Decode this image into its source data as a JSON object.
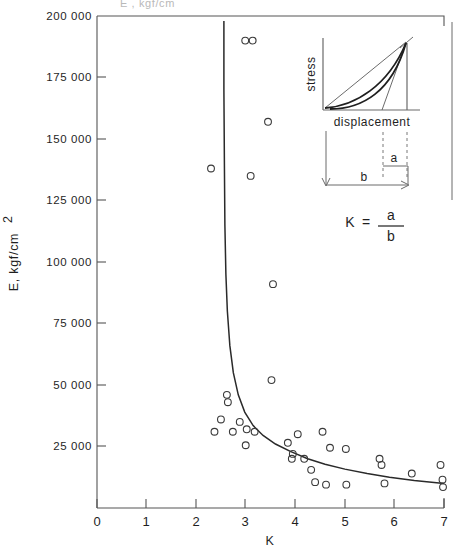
{
  "figure": {
    "top_cropped_text": "E , kgf/cm",
    "background_color": "#ffffff",
    "line_color": "#2a2a2a",
    "marker_color": "#3a3a3a"
  },
  "inset": {
    "y_label": "stress",
    "x_label": "displacement",
    "segment_a_label": "a",
    "segment_b_label": "b",
    "formula_lhs": "K",
    "formula_equals": "=",
    "formula_numerator": "a",
    "formula_denominator": "b"
  },
  "chart_data": {
    "type": "scatter",
    "title": "",
    "xlabel": "K",
    "ylabel": "E, kgf/cm2",
    "ylabel_display": "E, kgf/cm",
    "ylabel_exponent": "2",
    "xlim": [
      0,
      7
    ],
    "ylim": [
      0,
      200000
    ],
    "grid": false,
    "legend": "none",
    "xticks": [
      0,
      1,
      2,
      3,
      4,
      5,
      6,
      7
    ],
    "xtick_labels": [
      "0",
      "1",
      "2",
      "3",
      "4",
      "5",
      "6",
      "7"
    ],
    "yticks": [
      25000,
      50000,
      75000,
      100000,
      125000,
      150000,
      175000,
      200000
    ],
    "ytick_labels": [
      "25 000",
      "50 000",
      "75 000",
      "100 000",
      "125 000",
      "150 000",
      "175 000",
      "200 000"
    ],
    "series": [
      {
        "name": "measurements",
        "marker": "open-circle",
        "points": [
          [
            2.3,
            138000
          ],
          [
            2.99,
            190000
          ],
          [
            3.14,
            190000
          ],
          [
            3.1,
            135000
          ],
          [
            3.45,
            157000
          ],
          [
            3.55,
            91000
          ],
          [
            3.52,
            52000
          ],
          [
            2.62,
            46000
          ],
          [
            2.64,
            43000
          ],
          [
            2.5,
            36000
          ],
          [
            2.88,
            35000
          ],
          [
            2.37,
            31000
          ],
          [
            2.74,
            31000
          ],
          [
            3.02,
            32000
          ],
          [
            3.18,
            31000
          ],
          [
            3.0,
            25500
          ],
          [
            3.85,
            26500
          ],
          [
            3.95,
            22000
          ],
          [
            3.93,
            20000
          ],
          [
            4.05,
            30000
          ],
          [
            4.18,
            20000
          ],
          [
            4.55,
            31000
          ],
          [
            4.32,
            15500
          ],
          [
            4.7,
            24500
          ],
          [
            4.4,
            10500
          ],
          [
            4.62,
            9500
          ],
          [
            5.02,
            24000
          ],
          [
            5.03,
            9500
          ],
          [
            5.7,
            20000
          ],
          [
            5.74,
            17500
          ],
          [
            5.8,
            10000
          ],
          [
            6.35,
            14000
          ],
          [
            6.93,
            17500
          ],
          [
            6.97,
            11500
          ],
          [
            6.98,
            8500
          ]
        ]
      }
    ],
    "fit_curve": {
      "name": "hyperbolic-fit",
      "description": "steeply descending curve asymptotic near K=2.55",
      "points": [
        [
          2.56,
          198000
        ],
        [
          2.56,
          170000
        ],
        [
          2.57,
          140000
        ],
        [
          2.58,
          115000
        ],
        [
          2.6,
          95000
        ],
        [
          2.63,
          80000
        ],
        [
          2.68,
          66000
        ],
        [
          2.75,
          55000
        ],
        [
          2.85,
          46000
        ],
        [
          2.98,
          39000
        ],
        [
          3.15,
          33500
        ],
        [
          3.35,
          29500
        ],
        [
          3.6,
          26000
        ],
        [
          3.9,
          23000
        ],
        [
          4.25,
          20000
        ],
        [
          4.6,
          17800
        ],
        [
          5.0,
          15800
        ],
        [
          5.45,
          14000
        ],
        [
          5.9,
          12500
        ],
        [
          6.4,
          11200
        ],
        [
          7.0,
          10000
        ]
      ]
    }
  }
}
